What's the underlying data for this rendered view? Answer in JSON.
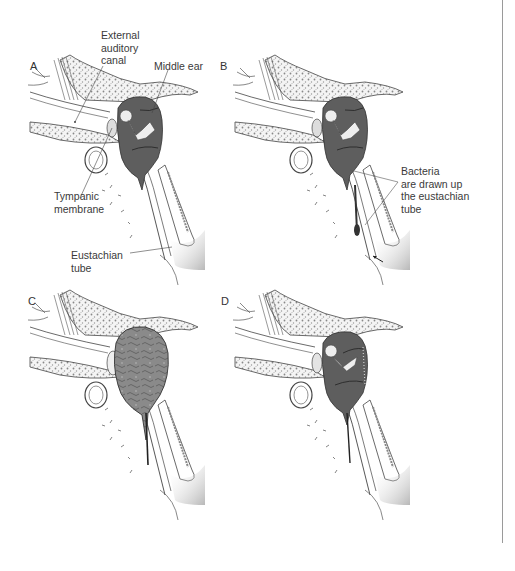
{
  "figure": {
    "panels": [
      {
        "id": "A",
        "letter": "A",
        "middle_ear_state": "normal, air-filled",
        "labels": {
          "external_auditory_canal": "External\nauditory\ncanal",
          "middle_ear": "Middle ear",
          "tympanic_membrane": "Tympanic\nmembrane",
          "eustachian_tube": "Eustachian\ntube"
        }
      },
      {
        "id": "B",
        "letter": "B",
        "middle_ear_state": "bacteria entering via eustachian tube",
        "labels": {
          "bacteria": "Bacteria\nare drawn up\nthe eustachian\ntube"
        }
      },
      {
        "id": "C",
        "letter": "C",
        "middle_ear_state": "middle ear filled with fluid / pus, bulging membrane",
        "labels": {}
      },
      {
        "id": "D",
        "letter": "D",
        "middle_ear_state": "resolving effusion",
        "labels": {}
      }
    ]
  },
  "colors": {
    "middle_ear_fill": "#5e5e5e",
    "effusion_fill": "#8a8a8a",
    "bone_stipple": "#e8e8e8",
    "line": "#444444",
    "divider": "#9a9a9a"
  }
}
